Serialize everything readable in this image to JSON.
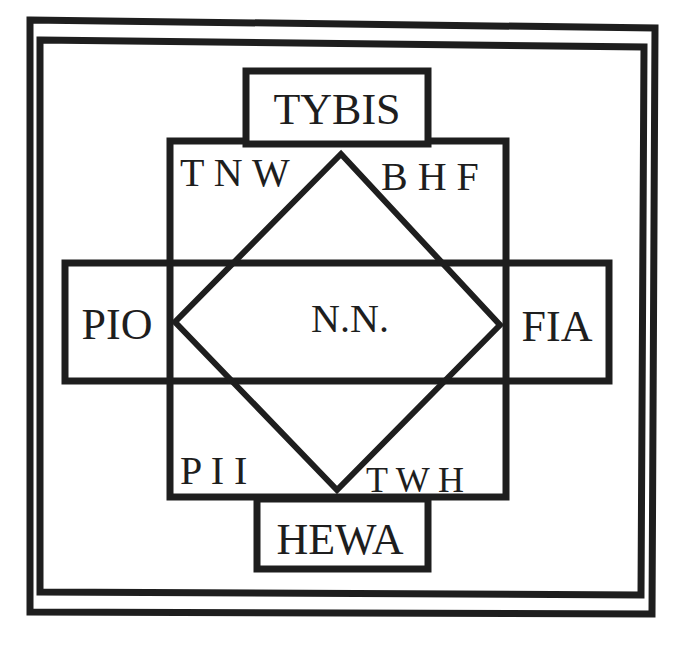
{
  "diagram": {
    "colors": {
      "background": "#ffffff",
      "stroke": "#1e1e1e",
      "text": "#1e1e1e"
    },
    "boxes": {
      "top": {
        "label": "TYBIS"
      },
      "left": {
        "label": "PIO"
      },
      "right": {
        "label": "FIA"
      },
      "bottom": {
        "label": "HEWA"
      }
    },
    "center": {
      "label": "N.N."
    },
    "corners": {
      "top_left": "T N W",
      "top_right": "B H F",
      "bottom_left": "P I I",
      "bottom_right": "T W H"
    }
  }
}
